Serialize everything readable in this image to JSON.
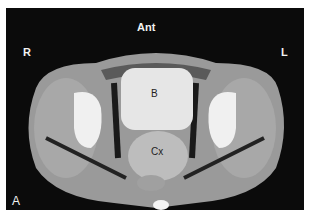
{
  "image": {
    "type": "axial CT scan of pelvis",
    "labels": {
      "anterior": "Ant",
      "right": "R",
      "left": "L",
      "bladder": "B",
      "cervix": "Cx",
      "panel": "A"
    }
  }
}
